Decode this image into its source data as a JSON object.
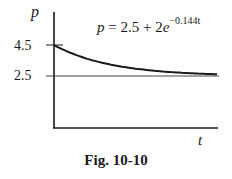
{
  "figure": {
    "caption": "Fig. 10-10",
    "equation": {
      "lhs": "p",
      "rhs_prefix": " = 2.5 + 2",
      "base": "e",
      "exponent": "−0.144t"
    }
  },
  "chart_data": {
    "type": "line",
    "title": "",
    "caption": "Fig. 10-10",
    "xlabel": "t",
    "ylabel": "p",
    "annotation": "p = 2.5 + 2e^(-0.144t)",
    "y_ticks": [
      {
        "value": 4.5,
        "label": "4.5"
      },
      {
        "value": 2.5,
        "label": "2.5"
      }
    ],
    "reference_lines": [
      {
        "type": "horizontal",
        "value": 2.5,
        "label": "asymptote"
      }
    ],
    "series": [
      {
        "name": "p(t) = 2.5 + 2e^(-0.144t)",
        "x": [
          0,
          2,
          4,
          6,
          8,
          10,
          12,
          14,
          16,
          18,
          20
        ],
        "values": [
          4.5,
          3.999,
          3.624,
          3.343,
          3.132,
          2.974,
          2.855,
          2.767,
          2.7,
          2.65,
          2.612
        ]
      }
    ],
    "xlim": [
      0,
      20
    ],
    "ylim": [
      0,
      5.5
    ],
    "grid": false,
    "legend": null
  },
  "labels": {
    "y_axis": "p",
    "x_axis": "t",
    "tick_high": "4.5",
    "tick_low": "2.5"
  }
}
